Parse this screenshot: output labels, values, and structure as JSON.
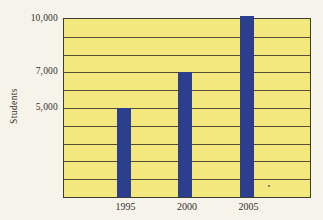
{
  "chart_data": {
    "type": "bar",
    "categories": [
      "1995",
      "2000",
      "2005"
    ],
    "values": [
      5000,
      7000,
      10000
    ],
    "title": "",
    "xlabel": "",
    "ylabel": "Students",
    "ylim": [
      0,
      10000
    ],
    "gridline_step": 1000,
    "grid": "horizontal",
    "legend": "none",
    "ytick_labels": [
      {
        "value": 5000,
        "label": "5,000"
      },
      {
        "value": 7000,
        "label": "7,000"
      },
      {
        "value": 10000,
        "label": "10,000"
      }
    ]
  },
  "colors": {
    "bar": "#2b3f8e",
    "plot_bg": "#f2e87e",
    "grid": "#403d2c",
    "page_bg": "#f6f3ea",
    "text": "#33312a"
  }
}
